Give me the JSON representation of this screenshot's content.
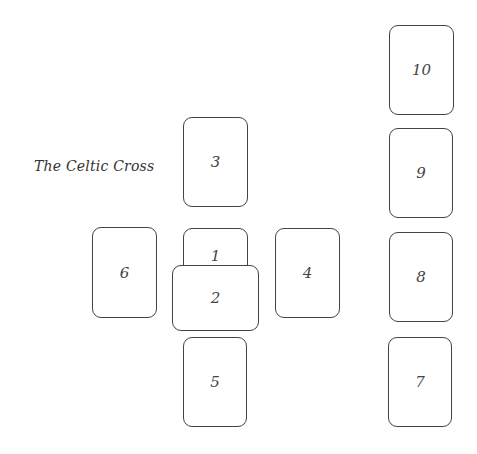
{
  "title": "The Celtic Cross",
  "cards": [
    {
      "label": "1",
      "position": "center"
    },
    {
      "label": "2",
      "position": "crossing"
    },
    {
      "label": "3",
      "position": "above"
    },
    {
      "label": "4",
      "position": "right"
    },
    {
      "label": "5",
      "position": "below"
    },
    {
      "label": "6",
      "position": "left"
    },
    {
      "label": "7",
      "position": "staff-1"
    },
    {
      "label": "8",
      "position": "staff-2"
    },
    {
      "label": "9",
      "position": "staff-3"
    },
    {
      "label": "10",
      "position": "staff-4"
    }
  ]
}
